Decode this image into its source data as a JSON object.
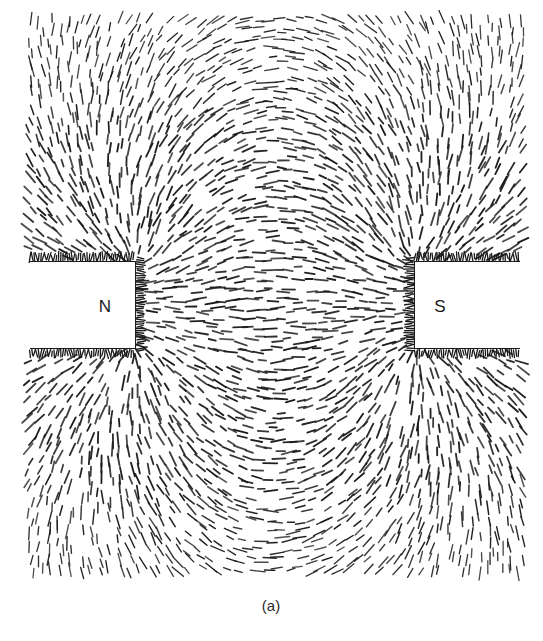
{
  "figure": {
    "caption": "(a)"
  },
  "magnets": {
    "north": {
      "label": "N",
      "x0": 30,
      "x1": 135,
      "y0": 262,
      "y1": 348,
      "label_x": 105,
      "label_y": 307
    },
    "south": {
      "label": "S",
      "x0": 415,
      "x1": 520,
      "y0": 262,
      "y1": 348,
      "label_x": 440,
      "label_y": 307
    }
  },
  "field_region": {
    "x0": 30,
    "x1": 520,
    "y0": 20,
    "y1": 578
  },
  "colors": {
    "filing": "#1a1a1a",
    "background": "#ffffff"
  },
  "caption_position": {
    "x": 271,
    "y": 605
  }
}
